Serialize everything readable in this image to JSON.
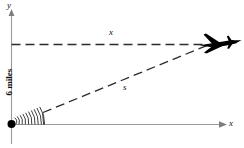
{
  "figure": {
    "type": "geometry-diagram"
  },
  "axes": {
    "x_label": "x",
    "y_label": "y",
    "x_axis_color": "#999999",
    "y_axis_color": "#999999"
  },
  "labels": {
    "vertical_distance": "6 miles",
    "horizontal_distance": "x",
    "hypotenuse": "s"
  },
  "elements": {
    "radar_station": "radar-station-dot",
    "radar_waves": "radar-wave-arcs",
    "airplane": "airplane-icon",
    "altitude_line": "dashed-horizontal-line",
    "slant_line": "dashed-diagonal-line"
  },
  "colors": {
    "stroke": "#1a1a1a",
    "axis": "#9a9a9a",
    "dash": "#2b2b2b",
    "plane_fill": "#000000"
  },
  "geometry": {
    "origin_x": 11,
    "origin_y": 124,
    "plane_x": 205,
    "plane_y": 45,
    "altitude_px": 80
  }
}
